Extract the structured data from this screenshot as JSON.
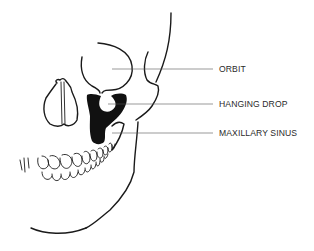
{
  "figure": {
    "type": "anatomical line drawing"
  },
  "labels": [
    {
      "text": "ORBIT",
      "y": 64
    },
    {
      "text": "HANGING DROP",
      "y": 99
    },
    {
      "text": "MAXILLARY SINUS",
      "y": 128
    }
  ],
  "colors": {
    "ink": "#1a1a1a",
    "background": "#ffffff",
    "label_text": "#2a2a2a"
  }
}
